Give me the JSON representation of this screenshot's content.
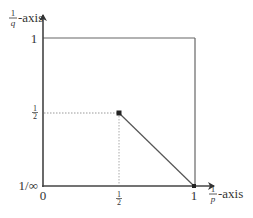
{
  "diagram": {
    "type": "interpolation-diagram",
    "x_axis": {
      "label_frac_num": "1",
      "label_frac_den": "p",
      "label_suffix": "-axis"
    },
    "y_axis": {
      "label_frac_num": "1",
      "label_frac_den": "q",
      "label_suffix": "-axis"
    },
    "x_ticks": [
      {
        "label": "0",
        "kind": "text"
      },
      {
        "label_num": "1",
        "label_den": "2",
        "kind": "fraction"
      },
      {
        "label": "1",
        "kind": "text"
      }
    ],
    "y_ticks": [
      {
        "label": "1/∞",
        "kind": "text"
      },
      {
        "label_num": "1",
        "label_den": "2",
        "kind": "fraction"
      },
      {
        "label": "1",
        "kind": "text"
      }
    ],
    "points": [
      {
        "x": 0.5,
        "y": 0.5
      },
      {
        "x": 1,
        "y": 0
      }
    ],
    "segments": [
      {
        "from": [
          0.5,
          0.5
        ],
        "to": [
          1,
          0
        ],
        "style": "solid"
      },
      {
        "from": [
          0,
          0.5
        ],
        "to": [
          0.5,
          0.5
        ],
        "style": "dotted"
      },
      {
        "from": [
          0.5,
          0
        ],
        "to": [
          0.5,
          0.5
        ],
        "style": "dotted"
      }
    ],
    "box": {
      "x_range": [
        0,
        1
      ],
      "y_range": [
        0,
        1
      ]
    },
    "colors": {
      "axis": "#444444",
      "box": "#666666",
      "line": "#555555",
      "dotted": "#999999"
    }
  }
}
